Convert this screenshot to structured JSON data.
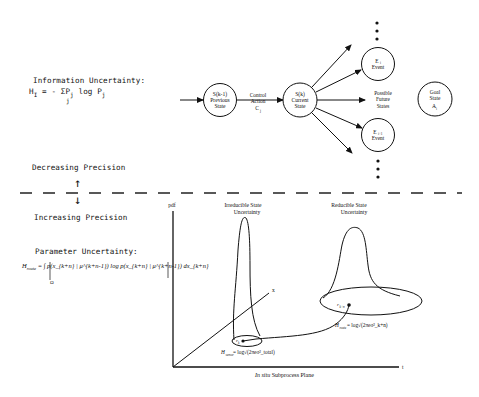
{
  "information_uncertainty": {
    "title": "Information Uncertainty:",
    "formula_lhs": "H",
    "formula_lhs_sub": "I",
    "formula_rhs_1": "= - ΣP",
    "formula_sum_sub": "j",
    "formula_p_sub": "j",
    "formula_rhs_2": "log P",
    "formula_log_sub": "j"
  },
  "precision": {
    "decreasing_label": "Decreasing Precision",
    "increasing_label": "Increasing Precision",
    "up_arrow": "↑",
    "down_arrow": "↓"
  },
  "parameter_uncertainty": {
    "title": "Parameter Uncertainty:",
    "formula_lhs": "H",
    "formula_lhs_sub": "route",
    "formula_body": "= ∫ p(x_{k+n} | μ^{k+n-1}) log p(x_{k+n} | μ^{k+n-1}) dx_{k+n}",
    "integral_domain": "Ω"
  },
  "state_diagram": {
    "previous_state": {
      "line1": "S(k-1)",
      "line2": "Previous",
      "line3": "State"
    },
    "control_action": {
      "line1": "Control",
      "line2": "Action",
      "line3": "C",
      "line3_sub": "j"
    },
    "current_state": {
      "line1": "S(k)",
      "line2": "Current",
      "line3": "State"
    },
    "event_i": {
      "line1": "E",
      "line1_sub": "i",
      "line2": "Event"
    },
    "event_i1": {
      "line1": "E",
      "line1_sub": "i+1",
      "line2": "Event"
    },
    "future_states": {
      "line1": "Possible",
      "line2": "Future",
      "line3": "States"
    },
    "goal_state": {
      "line1": "Goal",
      "line2": "State",
      "line3": "A",
      "line3_sub": "i"
    },
    "ellipsis": "⋮"
  },
  "pdf_plot": {
    "y_axis_label": "pdf",
    "x_axis_label": "x",
    "t_axis_label": "t",
    "irreducible_label_1": "Irreducible State",
    "irreducible_label_2": "Uncertainty",
    "reducible_label_1": "Reducible State",
    "reducible_label_2": "Uncertainty",
    "point_k": "r",
    "point_k_sub": "k",
    "point_kn": "r",
    "point_kn_sub": "k+n",
    "h_left": "H",
    "h_left_sub": "sensor",
    "h_left_rhs": "= log√(2πeσ²_total)",
    "h_right": "H",
    "h_right_sub": "route",
    "h_right_rhs": "= log√(2πeσ²_k+n)",
    "caption_italic": "In situ",
    "caption_rest": " Subprocess Plane"
  }
}
